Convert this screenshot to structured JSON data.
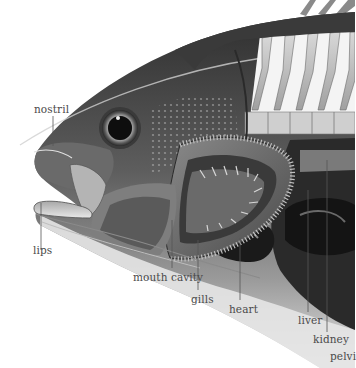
{
  "diagram": {
    "labels": [
      {
        "id": "nostril",
        "text": "nostril"
      },
      {
        "id": "lips",
        "text": "lips"
      },
      {
        "id": "mouth_cavity",
        "text": "mouth cavity"
      },
      {
        "id": "gills",
        "text": "gills"
      },
      {
        "id": "heart",
        "text": "heart"
      },
      {
        "id": "liver",
        "text": "liver"
      },
      {
        "id": "kidney",
        "text": "kidney"
      },
      {
        "id": "pelvic",
        "text": "pelvi"
      }
    ],
    "colors": {
      "background": "#ffffff",
      "body_dark": "#3a3a3a",
      "body_mid": "#6e6e6e",
      "body_light": "#b8b8b8",
      "belly": "#e4e4e4",
      "organ_dark": "#1e1e1e",
      "label_text": "#4a4a4a",
      "leader_line": "#555555"
    }
  }
}
